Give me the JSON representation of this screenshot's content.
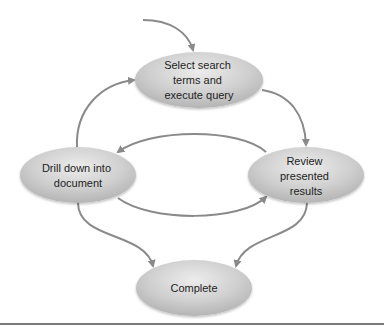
{
  "diagram": {
    "type": "cycle-flowchart",
    "colors": {
      "node_fill_light": "#ececec",
      "node_fill_dark": "#b4b4b4",
      "arrow": "#8a8a8a",
      "text": "#1e1e1e",
      "rule": "#7a7a7a"
    },
    "nodes": [
      {
        "id": "select",
        "lines": [
          "Select search",
          "terms and",
          "execute query"
        ]
      },
      {
        "id": "drill",
        "lines": [
          "Drill down into",
          "document"
        ]
      },
      {
        "id": "review",
        "lines": [
          "Review",
          "presented",
          "results"
        ]
      },
      {
        "id": "complete",
        "lines": [
          "Complete"
        ]
      }
    ],
    "edges": [
      {
        "from": "start",
        "to": "select"
      },
      {
        "from": "select",
        "to": "review"
      },
      {
        "from": "review",
        "to": "drill"
      },
      {
        "from": "drill",
        "to": "review"
      },
      {
        "from": "drill",
        "to": "select"
      },
      {
        "from": "drill",
        "to": "complete"
      },
      {
        "from": "review",
        "to": "complete"
      }
    ]
  }
}
